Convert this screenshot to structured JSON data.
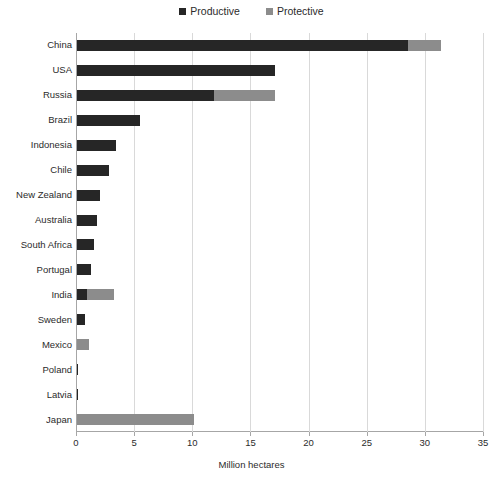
{
  "chart_data": {
    "type": "bar",
    "orientation": "horizontal",
    "stacked": true,
    "title": "",
    "xlabel": "Million hectares",
    "ylabel": "",
    "xlim": [
      0,
      35
    ],
    "xticks": [
      0,
      5,
      10,
      15,
      20,
      25,
      30,
      35
    ],
    "grid": "vertical",
    "legend_position": "top-center",
    "categories": [
      "China",
      "USA",
      "Russia",
      "Brazil",
      "Indonesia",
      "Chile",
      "New Zealand",
      "Australia",
      "South Africa",
      "Portugal",
      "India",
      "Sweden",
      "Mexico",
      "Poland",
      "Latvia",
      "Japan"
    ],
    "series": [
      {
        "name": "Productive",
        "color": "#262626",
        "values": [
          28.5,
          17.0,
          11.8,
          5.4,
          3.35,
          2.75,
          2.0,
          1.7,
          1.45,
          1.2,
          0.85,
          0.7,
          0.0,
          0.1,
          0.1,
          0.0
        ]
      },
      {
        "name": "Protective",
        "color": "#8c8c8c",
        "values": [
          2.8,
          0.0,
          5.2,
          0.0,
          0.0,
          0.0,
          0.0,
          0.0,
          0.0,
          0.0,
          2.35,
          0.0,
          1.0,
          0.0,
          0.0,
          10.1
        ]
      }
    ]
  },
  "legend": {
    "items": [
      {
        "label": "Productive",
        "color": "#262626"
      },
      {
        "label": "Protective",
        "color": "#8c8c8c"
      }
    ]
  },
  "axis": {
    "x_label": "Million hectares",
    "x_tick_labels": [
      "0",
      "5",
      "10",
      "15",
      "20",
      "25",
      "30",
      "35"
    ]
  }
}
